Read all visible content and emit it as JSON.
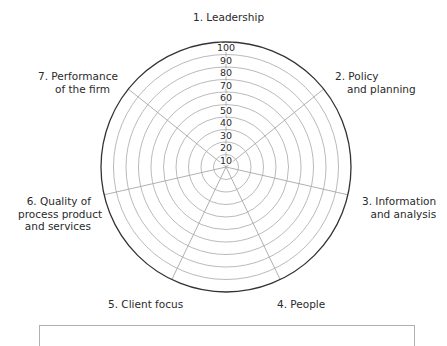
{
  "chart_data": {
    "type": "radar",
    "title": "",
    "axes": [
      {
        "id": 1,
        "label_lines": [
          "1. Leadership"
        ]
      },
      {
        "id": 2,
        "label_lines": [
          "2. Policy",
          "and planning"
        ]
      },
      {
        "id": 3,
        "label_lines": [
          "3. Information",
          "and analysis"
        ]
      },
      {
        "id": 4,
        "label_lines": [
          "4. People"
        ]
      },
      {
        "id": 5,
        "label_lines": [
          "5. Client focus"
        ]
      },
      {
        "id": 6,
        "label_lines": [
          "6. Quality of",
          "process product",
          "and services"
        ]
      },
      {
        "id": 7,
        "label_lines": [
          "7. Performance",
          "of the firm"
        ]
      }
    ],
    "radial_ticks": [
      10,
      20,
      30,
      40,
      50,
      60,
      70,
      80,
      90,
      100
    ],
    "rlim": [
      0,
      100
    ],
    "grid": true,
    "series": [],
    "legend": {
      "position": "bottom",
      "entries": []
    }
  },
  "labels": {
    "axis1": [
      "1. Leadership"
    ],
    "axis2": [
      "2. Policy",
      "and planning"
    ],
    "axis3": [
      "3. Information",
      "and analysis"
    ],
    "axis4": [
      "4. People"
    ],
    "axis5": [
      "5. Client focus"
    ],
    "axis6": [
      "6. Quality of",
      "process product",
      "and services"
    ],
    "axis7": [
      "7. Performance",
      "of the firm"
    ]
  },
  "colors": {
    "outer_ring": "#333333",
    "grid": "#a8a8a8",
    "text": "#2a2a2a"
  }
}
